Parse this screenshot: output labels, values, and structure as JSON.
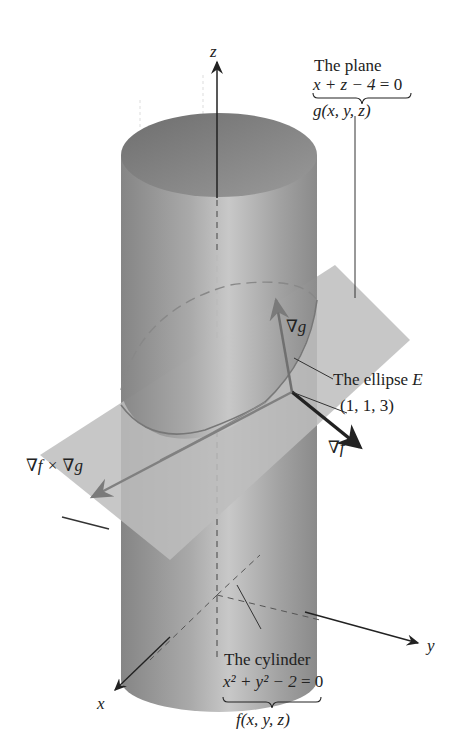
{
  "figure": {
    "axes": {
      "z": "z",
      "y": "y",
      "x": "x"
    },
    "plane": {
      "title": "The plane",
      "equation_left": "x + z − 4",
      "equation_right": "= 0",
      "function": "g(x, y, z)"
    },
    "cylinder": {
      "title": "The cylinder",
      "equation_left": "x² + y² − 2",
      "equation_right": "= 0",
      "function": "f(x, y, z)"
    },
    "ellipse_label": "The ellipse",
    "ellipse_symbol": "E",
    "point": "(1, 1, 3)",
    "vectors": {
      "grad_g": "∇g",
      "grad_f": "∇f",
      "cross": "∇f × ∇g"
    },
    "colors": {
      "cylinder_dark": "#7d7d7d",
      "cylinder_light": "#c4c4c4",
      "plane": "#bdbdbd",
      "grad_g_arrow": "#707070",
      "grad_f_arrow": "#2a2a2a",
      "cross_arrow": "#808080",
      "axis": "#222222"
    }
  }
}
